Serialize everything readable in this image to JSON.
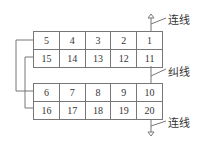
{
  "diagram": {
    "top_block": {
      "rows": [
        [
          "5",
          "4",
          "3",
          "2",
          "1"
        ],
        [
          "15",
          "14",
          "13",
          "12",
          "11"
        ]
      ]
    },
    "bottom_block": {
      "rows": [
        [
          "6",
          "7",
          "8",
          "9",
          "10"
        ],
        [
          "16",
          "17",
          "18",
          "19",
          "20"
        ]
      ]
    },
    "labels": {
      "top_connection": "连线",
      "middle_jumper": "纠线",
      "bottom_connection": "连线"
    },
    "colors": {
      "line": "#777777",
      "text": "#333333"
    }
  }
}
